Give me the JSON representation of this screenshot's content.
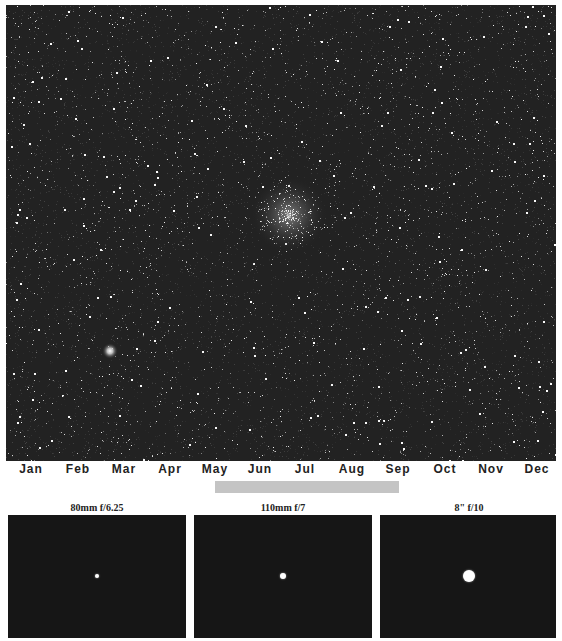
{
  "starfield": {
    "background": "#222222",
    "cluster": {
      "x": 283,
      "y": 210,
      "radius": 24
    },
    "bright_star": {
      "x": 104,
      "y": 346
    }
  },
  "months": [
    "Jan",
    "Feb",
    "Mar",
    "Apr",
    "May",
    "Jun",
    "Jul",
    "Aug",
    "Sep",
    "Oct",
    "Nov",
    "Dec"
  ],
  "visibility": {
    "start_label": "May",
    "end_label": "Sep",
    "color": "#c4c4c4"
  },
  "panels": [
    {
      "title": "80mm f/6.25",
      "dot_diameter": 4
    },
    {
      "title": "110mm f/7",
      "dot_diameter": 6
    },
    {
      "title": "8\" f/10",
      "dot_diameter": 12
    }
  ]
}
